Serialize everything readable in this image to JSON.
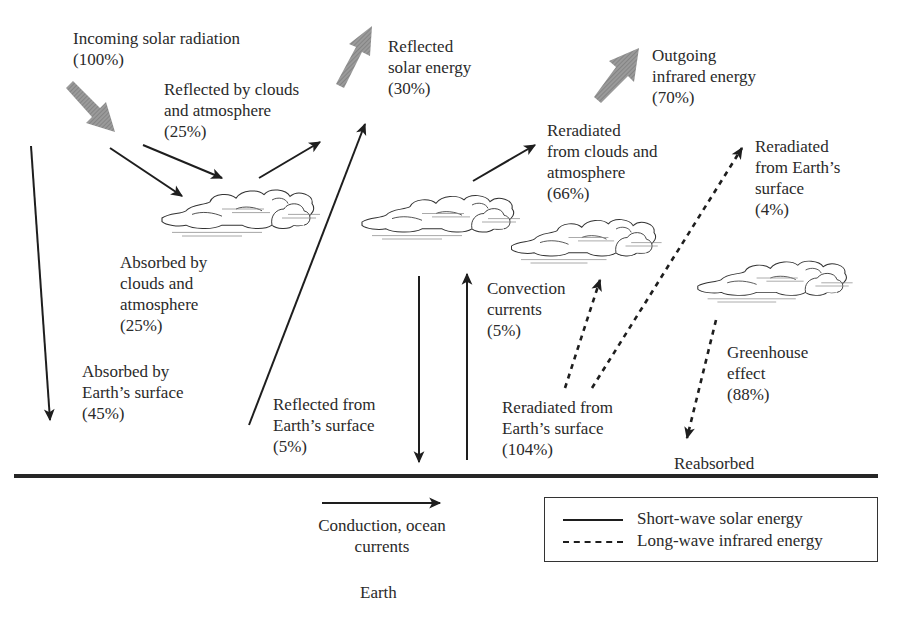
{
  "colors": {
    "ink": "#1e1e1e",
    "text": "#2a2a2a",
    "wide_arrow": "#8a8a8a",
    "background": "#ffffff"
  },
  "labels": {
    "incoming": {
      "line1": "Incoming solar radiation",
      "line2": "(100%)"
    },
    "reflected_clouds": {
      "line1": "Reflected by clouds",
      "line2": "and atmosphere",
      "line3": "(25%)"
    },
    "reflected_solar": {
      "line1": "Reflected",
      "line2": "solar energy",
      "line3": "(30%)"
    },
    "outgoing_ir": {
      "line1": "Outgoing",
      "line2": "infrared energy",
      "line3": "(70%)"
    },
    "reradiated_clouds": {
      "line1": "Reradiated",
      "line2": "from clouds and",
      "line3": "atmosphere",
      "line4": "(66%)"
    },
    "reradiated_surface_4": {
      "line1": "Reradiated",
      "line2": "from Earth’s",
      "line3": "surface",
      "line4": "(4%)"
    },
    "absorbed_clouds": {
      "line1": "Absorbed by",
      "line2": "clouds and",
      "line3": "atmosphere",
      "line4": "(25%)"
    },
    "absorbed_surface": {
      "line1": "Absorbed by",
      "line2": "Earth’s surface",
      "line3": "(45%)"
    },
    "reflected_surface": {
      "line1": "Reflected from",
      "line2": "Earth’s surface",
      "line3": "(5%)"
    },
    "convection": {
      "line1": "Convection",
      "line2": "currents",
      "line3": "(5%)"
    },
    "reradiated_surface_104": {
      "line1": "Reradiated from",
      "line2": "Earth’s surface",
      "line3": "(104%)"
    },
    "greenhouse": {
      "line1": "Greenhouse",
      "line2": "effect",
      "line3": "(88%)"
    },
    "reabsorbed": {
      "line1": "Reabsorbed"
    },
    "conduction": {
      "line1": "Conduction, ocean",
      "line2": "currents"
    },
    "earth": {
      "line1": "Earth"
    }
  },
  "legend": {
    "items": [
      {
        "style": "solid",
        "label": "Short-wave solar energy"
      },
      {
        "style": "dashed",
        "label": "Long-wave infrared energy"
      }
    ]
  }
}
